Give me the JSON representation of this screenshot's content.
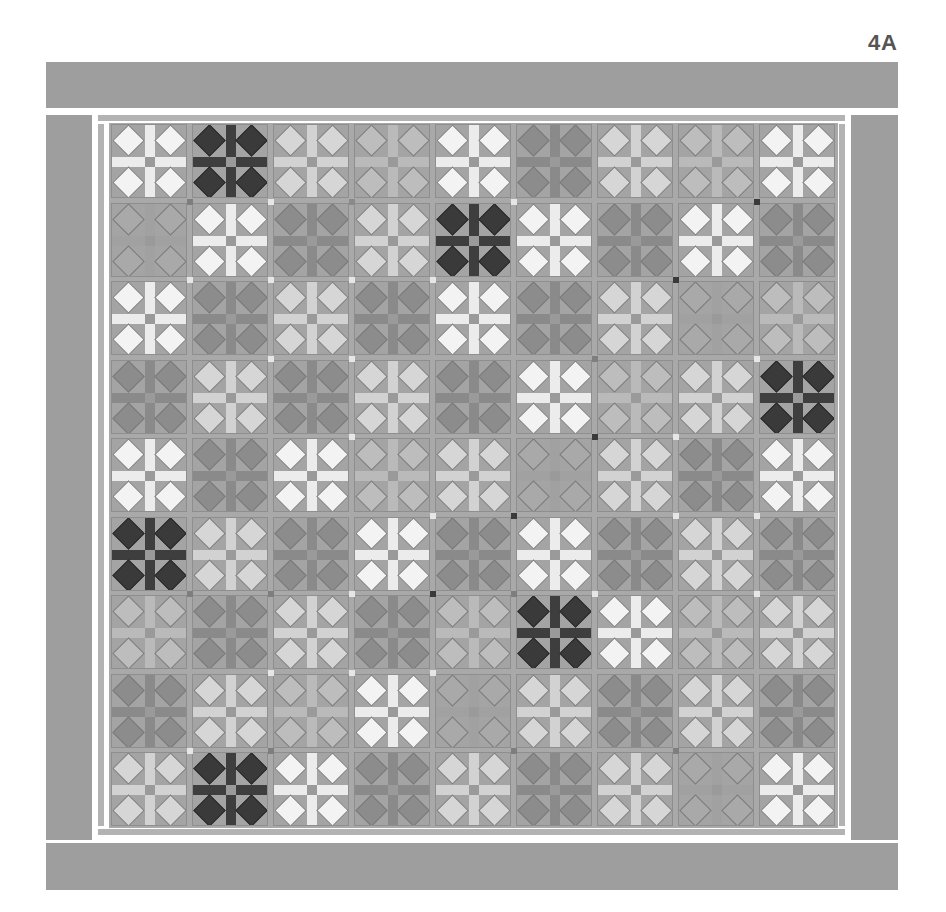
{
  "figure": {
    "label": "4A"
  },
  "palette": {
    "W": {
      "diamond": "#f3f3f3",
      "bar": "#ececec"
    },
    "L": {
      "diamond": "#d6d6d6",
      "bar": "#d2d2d2"
    },
    "M": {
      "diamond": "#bdbdbd",
      "bar": "#bababa"
    },
    "G": {
      "diamond": "#a9a9a9",
      "bar": "#a1a1a1"
    },
    "S": {
      "diamond": "#8c8c8c",
      "bar": "#8a8a8a"
    },
    "D": {
      "diamond": "#3a3a3a",
      "bar": "#3e3e3e"
    },
    "outer_border": "#9e9e9e",
    "inner_border": "#b3b3b3",
    "sashing": "#a9a9a9"
  },
  "grid": {
    "rows": 9,
    "cols": 9,
    "blocks": [
      [
        "W",
        "D",
        "L",
        "M",
        "W",
        "S",
        "L",
        "M",
        "W"
      ],
      [
        "G",
        "W",
        "S",
        "L",
        "D",
        "W",
        "S",
        "W",
        "S"
      ],
      [
        "W",
        "S",
        "L",
        "S",
        "W",
        "S",
        "L",
        "G",
        "M"
      ],
      [
        "S",
        "L",
        "S",
        "L",
        "S",
        "W",
        "M",
        "L",
        "D"
      ],
      [
        "W",
        "S",
        "W",
        "M",
        "L",
        "G",
        "L",
        "S",
        "W"
      ],
      [
        "D",
        "L",
        "S",
        "W",
        "S",
        "W",
        "S",
        "L",
        "S"
      ],
      [
        "M",
        "S",
        "L",
        "S",
        "M",
        "D",
        "W",
        "M",
        "L"
      ],
      [
        "S",
        "L",
        "M",
        "W",
        "G",
        "L",
        "S",
        "L",
        "S"
      ],
      [
        "L",
        "D",
        "W",
        "S",
        "L",
        "S",
        "L",
        "G",
        "W"
      ]
    ],
    "cornerstones": [
      {
        "r": 1,
        "c": 1,
        "tone": "#7e7e7e"
      },
      {
        "r": 1,
        "c": 2,
        "tone": "#e6e6e6"
      },
      {
        "r": 1,
        "c": 3,
        "tone": "#8a8a8a"
      },
      {
        "r": 1,
        "c": 5,
        "tone": "#e6e6e6"
      },
      {
        "r": 1,
        "c": 8,
        "tone": "#3a3a3a"
      },
      {
        "r": 2,
        "c": 1,
        "tone": "#e6e6e6"
      },
      {
        "r": 2,
        "c": 2,
        "tone": "#e6e6e6"
      },
      {
        "r": 2,
        "c": 3,
        "tone": "#e6e6e6"
      },
      {
        "r": 2,
        "c": 4,
        "tone": "#e6e6e6"
      },
      {
        "r": 2,
        "c": 7,
        "tone": "#3a3a3a"
      },
      {
        "r": 3,
        "c": 2,
        "tone": "#e6e6e6"
      },
      {
        "r": 3,
        "c": 3,
        "tone": "#e6e6e6"
      },
      {
        "r": 3,
        "c": 6,
        "tone": "#7e7e7e"
      },
      {
        "r": 3,
        "c": 8,
        "tone": "#e6e6e6"
      },
      {
        "r": 4,
        "c": 3,
        "tone": "#e6e6e6"
      },
      {
        "r": 4,
        "c": 6,
        "tone": "#3a3a3a"
      },
      {
        "r": 4,
        "c": 7,
        "tone": "#e6e6e6"
      },
      {
        "r": 5,
        "c": 4,
        "tone": "#e6e6e6"
      },
      {
        "r": 5,
        "c": 5,
        "tone": "#3a3a3a"
      },
      {
        "r": 5,
        "c": 7,
        "tone": "#e6e6e6"
      },
      {
        "r": 5,
        "c": 8,
        "tone": "#e6e6e6"
      },
      {
        "r": 6,
        "c": 1,
        "tone": "#7e7e7e"
      },
      {
        "r": 6,
        "c": 2,
        "tone": "#7e7e7e"
      },
      {
        "r": 6,
        "c": 3,
        "tone": "#e6e6e6"
      },
      {
        "r": 6,
        "c": 4,
        "tone": "#3a3a3a"
      },
      {
        "r": 6,
        "c": 5,
        "tone": "#7e7e7e"
      },
      {
        "r": 6,
        "c": 6,
        "tone": "#e6e6e6"
      },
      {
        "r": 6,
        "c": 8,
        "tone": "#e6e6e6"
      },
      {
        "r": 7,
        "c": 2,
        "tone": "#e6e6e6"
      },
      {
        "r": 7,
        "c": 3,
        "tone": "#e6e6e6"
      },
      {
        "r": 7,
        "c": 4,
        "tone": "#e6e6e6"
      },
      {
        "r": 8,
        "c": 1,
        "tone": "#e6e6e6"
      },
      {
        "r": 8,
        "c": 2,
        "tone": "#7e7e7e"
      },
      {
        "r": 8,
        "c": 5,
        "tone": "#7e7e7e"
      },
      {
        "r": 8,
        "c": 7,
        "tone": "#7e7e7e"
      }
    ]
  }
}
